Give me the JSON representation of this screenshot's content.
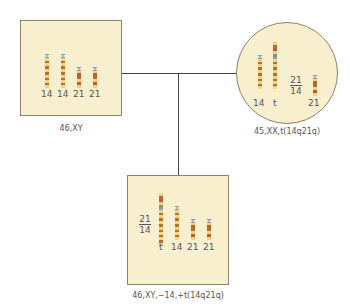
{
  "diagram": {
    "type": "pedigree-karyotype",
    "colors": {
      "panel_fill": "#f8efcf",
      "panel_border": "#8a8170",
      "connector": "#444444",
      "band_yellow": "#f2d37a",
      "band_brown": "#b0703a",
      "band_red": "#c05a3a",
      "band_green": "#7f9a7a",
      "centromere": "#8aa0b0"
    },
    "father": {
      "shape": "square",
      "karyotype": "46,XY",
      "chromosome_labels": [
        "14",
        "14",
        "21",
        "21"
      ]
    },
    "mother": {
      "shape": "circle",
      "karyotype": "45,XX,t(14q21q)",
      "chromosome_labels": [
        "14",
        "t",
        "21"
      ],
      "fraction": {
        "top": "21",
        "bottom": "14"
      }
    },
    "child": {
      "shape": "square",
      "karyotype": "46,XY,−14,+t(14q21q)",
      "chromosome_labels": [
        "t",
        "14",
        "21",
        "21"
      ],
      "fraction": {
        "top": "21",
        "bottom": "14"
      }
    }
  }
}
